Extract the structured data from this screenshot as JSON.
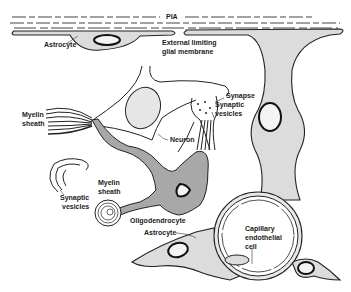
{
  "figure": {
    "type": "neuroglia-diagram",
    "labels": {
      "pia": "PIA",
      "astrocyte_top": "Astrocyte",
      "external_limiting_1": "External limiting",
      "external_limiting_2": "glial membrane",
      "synapse": "Synapse",
      "synaptic_vesicles_top_1": "Synaptic",
      "synaptic_vesicles_top_2": "vesicles",
      "myelin_sheath_left_1": "Myelin",
      "myelin_sheath_left_2": "sheath",
      "neuron": "Neuron",
      "synaptic_vesicles_left_1": "Synaptic",
      "synaptic_vesicles_left_2": "vesicles",
      "myelin_sheath_mid_1": "Myelin",
      "myelin_sheath_mid_2": "sheath",
      "oligodendrocyte": "Oligodendrocyte",
      "astrocyte_bottom": "Astrocyte",
      "capillary_1": "Capillary",
      "capillary_2": "endothelial",
      "capillary_3": "cell"
    },
    "colors": {
      "glia_fill": "#dcdcdc",
      "oligodendrocyte_fill": "#a8a8a8",
      "line": "#222222",
      "background": "#ffffff"
    }
  }
}
